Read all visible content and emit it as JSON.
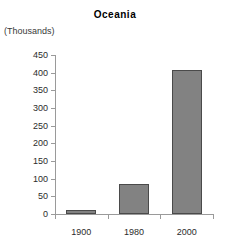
{
  "chart_data": {
    "type": "bar",
    "title": "Oceania",
    "units_caption": "(Thousands)",
    "xlabel": "",
    "ylabel": "",
    "categories": [
      "1900",
      "1980",
      "2000"
    ],
    "values": [
      11,
      85,
      408
    ],
    "ylim": [
      0,
      450
    ],
    "ytick_values": [
      0,
      50,
      100,
      150,
      200,
      250,
      300,
      350,
      400,
      450
    ],
    "ytick_labels": [
      "0",
      "50",
      "100",
      "150",
      "200",
      "250",
      "300",
      "350",
      "400",
      "450"
    ],
    "grid": false,
    "legend": false,
    "series": [
      {
        "name": "Oceania",
        "values": [
          11,
          85,
          408
        ],
        "color": "#828282",
        "border_color": "#4a4a4a"
      }
    ],
    "colors": {
      "bar_fill": "#828282",
      "bar_border": "#4a4a4a",
      "axis": "#9a9a9a",
      "text": "#2b2b2b",
      "title": "#000000",
      "background": "#ffffff"
    }
  }
}
